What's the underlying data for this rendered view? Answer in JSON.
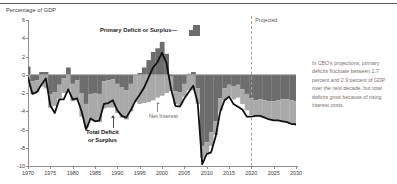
{
  "axis_title": "Percentage of GDP",
  "labels": {
    "primary": "Primary Deficit or Surplus",
    "primary_dash": "—",
    "total_line1": "Total Deficit",
    "total_line2": "or Surplus",
    "net_interest": "Net Interest",
    "projected": "Projected"
  },
  "side_note": "In CBO's projections, primary deficits fluctuate between 2.7 percent and 2.9 percent of GDP over the next decade, but total deficits grow because of rising interest costs.",
  "colors": {
    "primary_bar": "#6d6d6d",
    "net_interest_bar": "#a9a9a9",
    "total_line": "#111111",
    "axis": "#8c8c8c",
    "note_text": "#7a6f6a"
  },
  "chart_data": {
    "type": "bar",
    "title": "",
    "xlabel": "",
    "ylabel": "Percentage of GDP",
    "xlim": [
      1970,
      2030
    ],
    "ylim": [
      -10,
      6
    ],
    "grid": false,
    "legend": "inline-annotations",
    "projection_start": 2020,
    "ytick_values": [
      6,
      4,
      2,
      0,
      -2,
      -4,
      -6,
      -8,
      -10
    ],
    "xtick_values": [
      1970,
      1975,
      1980,
      1985,
      1990,
      1995,
      2000,
      2005,
      2010,
      2015,
      2020,
      2025,
      2030
    ],
    "x": [
      1970,
      1971,
      1972,
      1973,
      1974,
      1975,
      1976,
      1977,
      1978,
      1979,
      1980,
      1981,
      1982,
      1983,
      1984,
      1985,
      1986,
      1987,
      1988,
      1989,
      1990,
      1991,
      1992,
      1993,
      1994,
      1995,
      1996,
      1997,
      1998,
      1999,
      2000,
      2001,
      2002,
      2003,
      2004,
      2005,
      2006,
      2007,
      2008,
      2009,
      2010,
      2011,
      2012,
      2013,
      2014,
      2015,
      2016,
      2017,
      2018,
      2019,
      2020,
      2021,
      2022,
      2023,
      2024,
      2025,
      2026,
      2027,
      2028,
      2029,
      2030
    ],
    "series": [
      {
        "name": "Primary Deficit or Surplus",
        "type": "bar",
        "color": "#6d6d6d",
        "values": [
          0.9,
          -0.7,
          -0.6,
          0.3,
          0.3,
          -2.1,
          -1.9,
          -1.1,
          -0.4,
          0.8,
          -1.0,
          -0.6,
          -2.0,
          -3.2,
          -2.1,
          -2.0,
          -2.1,
          -0.7,
          -0.6,
          -0.5,
          -1.0,
          -1.4,
          -1.7,
          -1.0,
          -0.1,
          0.2,
          0.8,
          1.6,
          2.5,
          2.9,
          3.6,
          2.3,
          -0.2,
          -1.8,
          -1.9,
          -1.0,
          0.1,
          0.3,
          -1.5,
          -7.8,
          -7.4,
          -6.3,
          -5.1,
          -2.6,
          -1.5,
          -1.1,
          -1.3,
          -1.1,
          -1.6,
          -2.1,
          -2.6,
          -2.8,
          -2.7,
          -2.8,
          -2.9,
          -2.9,
          -2.8,
          -2.7,
          -2.7,
          -2.8,
          -2.9
        ]
      },
      {
        "name": "Net Interest",
        "type": "bar",
        "color": "#a9a9a9",
        "values": [
          -1.4,
          -1.4,
          -1.3,
          -1.3,
          -1.5,
          -1.5,
          -1.5,
          -1.5,
          -1.6,
          -1.7,
          -1.9,
          -2.2,
          -2.6,
          -2.6,
          -2.9,
          -3.1,
          -3.1,
          -3.0,
          -3.0,
          -3.1,
          -3.2,
          -3.3,
          -3.2,
          -3.0,
          -2.9,
          -3.2,
          -3.1,
          -3.0,
          -2.8,
          -2.5,
          -2.3,
          -2.0,
          -1.6,
          -1.4,
          -1.4,
          -1.4,
          -1.7,
          -1.7,
          -1.7,
          -1.3,
          -1.3,
          -1.5,
          -1.5,
          -1.3,
          -1.3,
          -1.3,
          -1.4,
          -1.4,
          -1.6,
          -1.8,
          -1.8,
          -1.7,
          -1.8,
          -1.9,
          -2.0,
          -2.1,
          -2.2,
          -2.4,
          -2.5,
          -2.6,
          -2.7
        ]
      }
    ],
    "total_line": {
      "name": "Total Deficit or Surplus",
      "type": "line",
      "color": "#111111",
      "values": [
        -0.3,
        -2.1,
        -1.9,
        -1.1,
        -0.4,
        -3.4,
        -4.2,
        -2.7,
        -2.7,
        -1.6,
        -2.7,
        -2.6,
        -4.0,
        -6.0,
        -4.8,
        -5.1,
        -5.0,
        -3.2,
        -3.1,
        -2.8,
        -3.9,
        -4.5,
        -4.7,
        -3.9,
        -2.9,
        -2.2,
        -1.4,
        -0.3,
        0.8,
        1.4,
        2.4,
        1.3,
        -1.5,
        -3.4,
        -3.5,
        -2.6,
        -1.9,
        -1.2,
        -3.1,
        -9.8,
        -8.7,
        -8.5,
        -6.8,
        -4.1,
        -2.8,
        -2.4,
        -3.2,
        -3.5,
        -3.8,
        -4.6,
        -4.6,
        -4.5,
        -4.5,
        -4.7,
        -4.9,
        -5.0,
        -5.0,
        -5.1,
        -5.2,
        -5.4,
        -5.4
      ]
    }
  }
}
